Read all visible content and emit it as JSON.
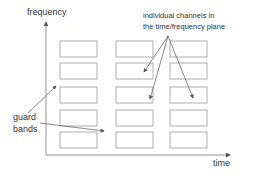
{
  "diagram": {
    "axis_y_label": "frequency",
    "axis_x_label": "time",
    "annotation_channels_line1": "individual channels in",
    "annotation_channels_line2": "the time/frequency plane",
    "annotation_guard_line1": "guard",
    "annotation_guard_line2": "bands",
    "grid": {
      "rows": 5,
      "columns": 3
    },
    "colors": {
      "line": "#777777",
      "box": "#999999",
      "text": "#333333"
    }
  }
}
